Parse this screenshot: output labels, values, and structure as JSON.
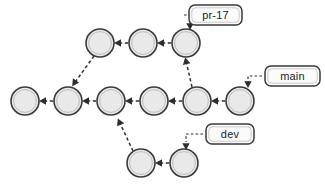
{
  "diagram": {
    "colors": {
      "node_fill": "#e9e9e9",
      "node_stroke": "#3a3a3a",
      "edge": "#2e2e2e",
      "label_fill": "#fbfbfb",
      "label_stroke": "#3a3a3a",
      "background": "#ffffff"
    },
    "node_radius": 14,
    "commits": [
      {
        "id": "m0",
        "row": "main",
        "cx": 25,
        "cy": 101,
        "name": "commit-node-main-1"
      },
      {
        "id": "m1",
        "row": "main",
        "cx": 68,
        "cy": 101,
        "name": "commit-node-main-2"
      },
      {
        "id": "m2",
        "row": "main",
        "cx": 111,
        "cy": 101,
        "name": "commit-node-main-3"
      },
      {
        "id": "m3",
        "row": "main",
        "cx": 154,
        "cy": 101,
        "name": "commit-node-main-4"
      },
      {
        "id": "m4",
        "row": "main",
        "cx": 197,
        "cy": 101,
        "name": "commit-node-main-5"
      },
      {
        "id": "m5",
        "row": "main",
        "cx": 240,
        "cy": 101,
        "name": "commit-node-main-6"
      },
      {
        "id": "p0",
        "row": "pr-17",
        "cx": 100,
        "cy": 43,
        "name": "commit-node-pr17-1"
      },
      {
        "id": "p1",
        "row": "pr-17",
        "cx": 143,
        "cy": 43,
        "name": "commit-node-pr17-2"
      },
      {
        "id": "p2",
        "row": "pr-17",
        "cx": 186,
        "cy": 43,
        "name": "commit-node-pr17-3"
      },
      {
        "id": "d0",
        "row": "dev",
        "cx": 141,
        "cy": 163,
        "name": "commit-node-dev-1"
      },
      {
        "id": "d1",
        "row": "dev",
        "cx": 184,
        "cy": 163,
        "name": "commit-node-dev-2"
      }
    ],
    "edges": [
      {
        "from": "m1",
        "to": "m0",
        "kind": "horizontal",
        "name": "edge-main2-to-main1"
      },
      {
        "from": "m2",
        "to": "m1",
        "kind": "horizontal",
        "name": "edge-main3-to-main2"
      },
      {
        "from": "m3",
        "to": "m2",
        "kind": "horizontal",
        "name": "edge-main4-to-main3"
      },
      {
        "from": "m4",
        "to": "m3",
        "kind": "horizontal",
        "name": "edge-main5-to-main4"
      },
      {
        "from": "m5",
        "to": "m4",
        "kind": "horizontal",
        "name": "edge-main6-to-main5"
      },
      {
        "from": "p1",
        "to": "p0",
        "kind": "horizontal",
        "name": "edge-pr17-2-to-pr17-1"
      },
      {
        "from": "p2",
        "to": "p1",
        "kind": "horizontal",
        "name": "edge-pr17-3-to-pr17-2"
      },
      {
        "from": "d1",
        "to": "d0",
        "kind": "horizontal",
        "name": "edge-dev2-to-dev1"
      },
      {
        "from": "p0",
        "to": "m1",
        "kind": "diagonal",
        "name": "edge-pr17-1-to-main2"
      },
      {
        "from": "m4",
        "to": "p2",
        "kind": "diagonal",
        "name": "edge-main5-to-pr17-3"
      },
      {
        "from": "d0",
        "to": "m2",
        "kind": "diagonal",
        "name": "edge-dev1-to-main3"
      }
    ],
    "ref_labels": [
      {
        "id": "pr-17",
        "text": "pr-17",
        "name": "ref-label-pr-17",
        "box": {
          "x": 189,
          "y": 5,
          "w": 53,
          "h": 20,
          "rx": 6
        },
        "connector": {
          "x1": 164,
          "y1": 15,
          "x2": 186,
          "y2": 15,
          "tip_x": 186,
          "tip_y": 29,
          "elbow": true
        },
        "name_connector": "ref-connector-pr-17"
      },
      {
        "id": "main",
        "text": "main",
        "name": "ref-label-main",
        "box": {
          "x": 265,
          "y": 66,
          "w": 55,
          "h": 20,
          "rx": 6
        },
        "connector": {
          "x1": 246,
          "y1": 76,
          "x2": 262,
          "y2": 76,
          "tip_x": 246,
          "tip_y": 89,
          "elbow": true
        },
        "name_connector": "ref-connector-main"
      },
      {
        "id": "dev",
        "text": "dev",
        "name": "ref-label-dev",
        "box": {
          "x": 206,
          "y": 124,
          "w": 48,
          "h": 20,
          "rx": 6
        },
        "connector": {
          "x1": 190,
          "y1": 134,
          "x2": 203,
          "y2": 134,
          "tip_x": 190,
          "tip_y": 148,
          "elbow": true
        },
        "name_connector": "ref-connector-dev"
      }
    ],
    "branch_names": [
      "pr-17",
      "main",
      "dev"
    ]
  }
}
